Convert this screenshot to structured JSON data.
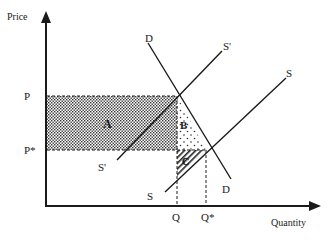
{
  "diagram": {
    "type": "supply-demand-tax-incidence",
    "axes": {
      "y_label": "Price",
      "x_label": "Quantity"
    },
    "price_ticks": [
      {
        "label": "P",
        "y": 96
      },
      {
        "label": "P*",
        "y": 150
      }
    ],
    "quantity_ticks": [
      {
        "label": "Q",
        "x": 177
      },
      {
        "label": "Q*",
        "x": 206
      }
    ],
    "curves": [
      {
        "name": "D",
        "start_label": "D",
        "end_label": "D",
        "from": [
          148,
          43
        ],
        "to": [
          231,
          179
        ]
      },
      {
        "name": "S'",
        "start_label": "S'",
        "end_label": "S'",
        "from": [
          117,
          160
        ],
        "to": [
          222,
          51
        ]
      },
      {
        "name": "S",
        "start_label": "S",
        "end_label": "S",
        "from": [
          165,
          192
        ],
        "to": [
          286,
          78
        ]
      }
    ],
    "regions": [
      {
        "label": "A",
        "pattern": "dense-dots",
        "description": "rectangle between P and P*, from price axis to Q"
      },
      {
        "label": "B",
        "pattern": "sparse-dots",
        "description": "triangle between P and P*, from Q to demand curve"
      },
      {
        "label": "C",
        "pattern": "diagonal-hatch",
        "description": "triangle below P*, between Q, supply S and P*"
      }
    ],
    "colors": {
      "ink": "#1a1a1a",
      "background": "#ffffff"
    }
  }
}
